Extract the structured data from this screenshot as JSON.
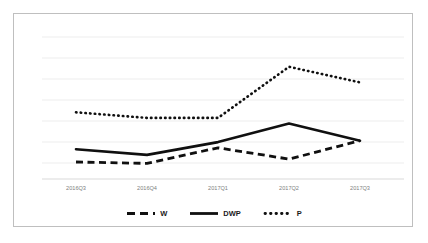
{
  "chart_data": {
    "type": "line",
    "title": "",
    "xlabel": "",
    "ylabel": "",
    "categories": [
      "2016Q3",
      "2016Q4",
      "2017Q1",
      "2017Q2",
      "2017Q3"
    ],
    "series": [
      {
        "name": "W",
        "style": "dashed",
        "color": "#101010",
        "values": [
          12,
          11,
          22,
          14,
          27
        ]
      },
      {
        "name": "DWP",
        "style": "solid",
        "color": "#101010",
        "values": [
          21,
          17,
          26,
          39,
          27
        ]
      },
      {
        "name": "P",
        "style": "dotted",
        "color": "#101010",
        "values": [
          47,
          43,
          43,
          79,
          68
        ]
      }
    ],
    "ylim": [
      0,
      100
    ],
    "gridlines": 7,
    "grid": true,
    "legend_position": "bottom"
  },
  "axis": {
    "tick_labels": [
      "2016Q3",
      "2016Q4",
      "2017Q1",
      "2017Q2",
      "2017Q3"
    ]
  },
  "legend": {
    "entries": [
      {
        "label": "W",
        "marker": "dashed-line-marker"
      },
      {
        "label": "DWP",
        "marker": "solid-line-marker"
      },
      {
        "label": "P",
        "marker": "dotted-line-marker"
      }
    ]
  },
  "colors": {
    "frame_border": "#bfbfbf",
    "gridline": "#ededed",
    "axis_line": "#d9d9d9",
    "series_ink": "#101010",
    "tick_text": "#808080"
  }
}
